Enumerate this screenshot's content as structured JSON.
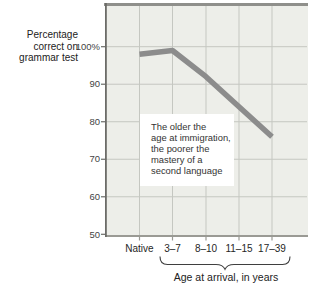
{
  "figure": {
    "y_axis_title": "Percentage\ncorrect on\ngrammar test",
    "x_axis_title": "Age at arrival, in years",
    "annotation": "The older the\nage at immigration,\nthe poorer the\nmastery of a\nsecond language"
  },
  "chart_data": {
    "type": "line",
    "title": "",
    "categories": [
      "Native",
      "3–7",
      "8–10",
      "11–15",
      "17–39"
    ],
    "values": [
      98,
      99,
      92,
      84,
      76
    ],
    "series": [
      {
        "name": "Percentage correct on grammar test",
        "values": [
          98,
          99,
          92,
          84,
          76
        ]
      }
    ],
    "xlabel": "Age at arrival, in years",
    "ylabel": "Percentage correct on grammar test",
    "ytick_labels": [
      "100%",
      "90",
      "80",
      "70",
      "60",
      "50"
    ],
    "ytick_values": [
      100,
      90,
      80,
      70,
      60,
      50
    ],
    "ylim": [
      50,
      111
    ],
    "grid": true,
    "legend": "none",
    "annotation": "The older the age at immigration, the poorer the mastery of a second language",
    "x_brace_span": [
      "3–7",
      "17–39"
    ],
    "colors": {
      "line": "#8c8c8c",
      "plot_bg": "#edeee9",
      "gridline": "#c5c7c1",
      "top_border": "#8f8f8b",
      "bottom_axis": "#9a9a94",
      "left_axis": "#6c6c68",
      "brace": "#3f3f3f",
      "text": "#222222"
    }
  }
}
